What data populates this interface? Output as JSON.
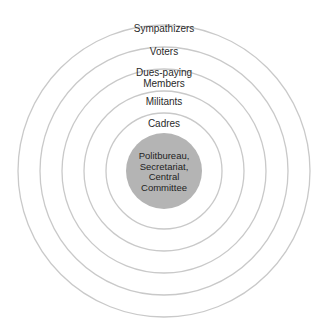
{
  "diagram": {
    "type": "concentric-circles",
    "center": {
      "x": 164,
      "y": 171
    },
    "colors": {
      "ring_stroke": "#c9c9c9",
      "core_fill": "#b4b4b4",
      "text": "#2a2a2a",
      "background": "#ffffff"
    },
    "rings": [
      {
        "label": "Sympathizers",
        "radius": 146
      },
      {
        "label": "Voters",
        "radius": 124
      },
      {
        "label": "Dues-paying Members",
        "line1": "Dues-paying",
        "line2": "Members",
        "radius": 102
      },
      {
        "label": "Militants",
        "radius": 80
      },
      {
        "label": "Cadres",
        "radius": 58
      }
    ],
    "core": {
      "label": "Politbureau, Secretariat, Central Committee",
      "lines": [
        "Politbureau,",
        "Secretariat,",
        "Central",
        "Committee"
      ],
      "radius": 38
    }
  }
}
